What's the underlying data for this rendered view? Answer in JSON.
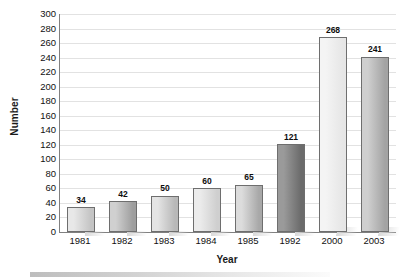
{
  "chart_data": {
    "type": "bar",
    "title": "",
    "xlabel": "Year",
    "ylabel": "Number",
    "categories": [
      "1981",
      "1982",
      "1983",
      "1984",
      "1985",
      "1992",
      "2000",
      "2003"
    ],
    "values": [
      34,
      42,
      50,
      60,
      65,
      121,
      268,
      241
    ],
    "value_labels": [
      "34",
      "42",
      "50",
      "60",
      "65",
      "121",
      "268",
      "241"
    ],
    "ylim": [
      0,
      300
    ],
    "ytick_step": 20,
    "yticks": [
      300,
      280,
      260,
      240,
      220,
      200,
      180,
      160,
      140,
      120,
      100,
      80,
      60,
      40,
      20,
      0
    ],
    "ytick_labels": [
      "300",
      "280",
      "260",
      "240",
      "220",
      "200",
      "180",
      "160",
      "140",
      "120",
      "100",
      "80",
      "60",
      "40",
      "20",
      "0"
    ],
    "grid": true,
    "grid_axis": "y",
    "legend": false,
    "legend_position": "none",
    "bar_fill_light": [
      "#e8e8e8",
      "#d0d0d0",
      "#e4e4e4",
      "#ececec",
      "#dcdcdc",
      "#9a9a9a",
      "#f4f4f4",
      "#cfcfcf"
    ],
    "bar_fill_dark": [
      "#c4c4c4",
      "#9e9e9e",
      "#b8b8b8",
      "#cfcfcf",
      "#a8a8a8",
      "#6b6b6b",
      "#e6e6e6",
      "#a3a3a3"
    ]
  },
  "axis": {
    "y_title": "Number",
    "x_title": "Year"
  },
  "colors": {
    "background": "#ffffff",
    "gridline": "#e2e2e2",
    "axis_line": "#808080",
    "bar_border": "#6e6e6e",
    "text": "#111111"
  }
}
